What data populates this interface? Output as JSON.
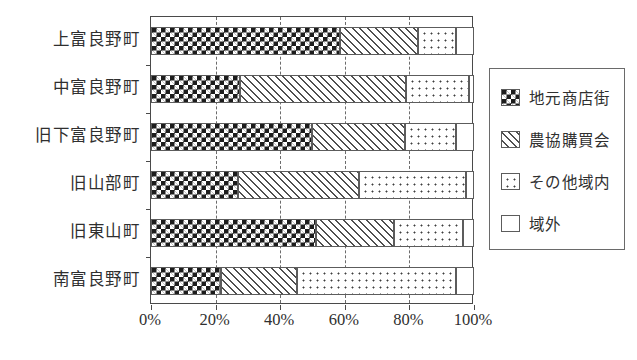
{
  "chart_data": {
    "type": "bar",
    "orientation": "horizontal",
    "stacked": true,
    "normalized": "100%",
    "title": "",
    "xlabel": "",
    "ylabel": "",
    "xlim": [
      0,
      100
    ],
    "grid": true,
    "legend_position": "right",
    "x_ticks": [
      "0%",
      "20%",
      "40%",
      "60%",
      "80%",
      "100%"
    ],
    "x_tick_values": [
      0,
      20,
      40,
      60,
      80,
      100
    ],
    "categories": [
      "上富良野町",
      "中富良野町",
      "旧下富良野町",
      "旧山部町",
      "旧東山町",
      "南富良野町"
    ],
    "series": [
      {
        "name": "地元商店街",
        "pattern": "checkerboard",
        "values": [
          58.5,
          27.5,
          49.8,
          27.0,
          51.0,
          21.7
        ]
      },
      {
        "name": "農協購買会",
        "pattern": "diagonal-hatch",
        "values": [
          24.2,
          51.5,
          28.8,
          37.4,
          24.2,
          23.5
        ]
      },
      {
        "name": "その他域内",
        "pattern": "dotted",
        "values": [
          11.7,
          19.5,
          15.8,
          33.1,
          21.4,
          49.2
        ]
      },
      {
        "name": "域外",
        "pattern": "plain-white",
        "values": [
          5.6,
          1.5,
          5.6,
          2.5,
          3.4,
          5.6
        ]
      }
    ]
  },
  "legend": {
    "items": [
      {
        "label": "地元商店街",
        "pattern": "checkerboard"
      },
      {
        "label": "農協購買会",
        "pattern": "diagonal-hatch"
      },
      {
        "label": "その他域内",
        "pattern": "dotted"
      },
      {
        "label": "域外",
        "pattern": "plain-white"
      }
    ]
  },
  "colors": {
    "axis": "#4a4a4a",
    "gridline": "#6b6b6b",
    "text": "#2f2f2f",
    "fill_dark": "#1c1c1c",
    "background": "#ffffff"
  }
}
